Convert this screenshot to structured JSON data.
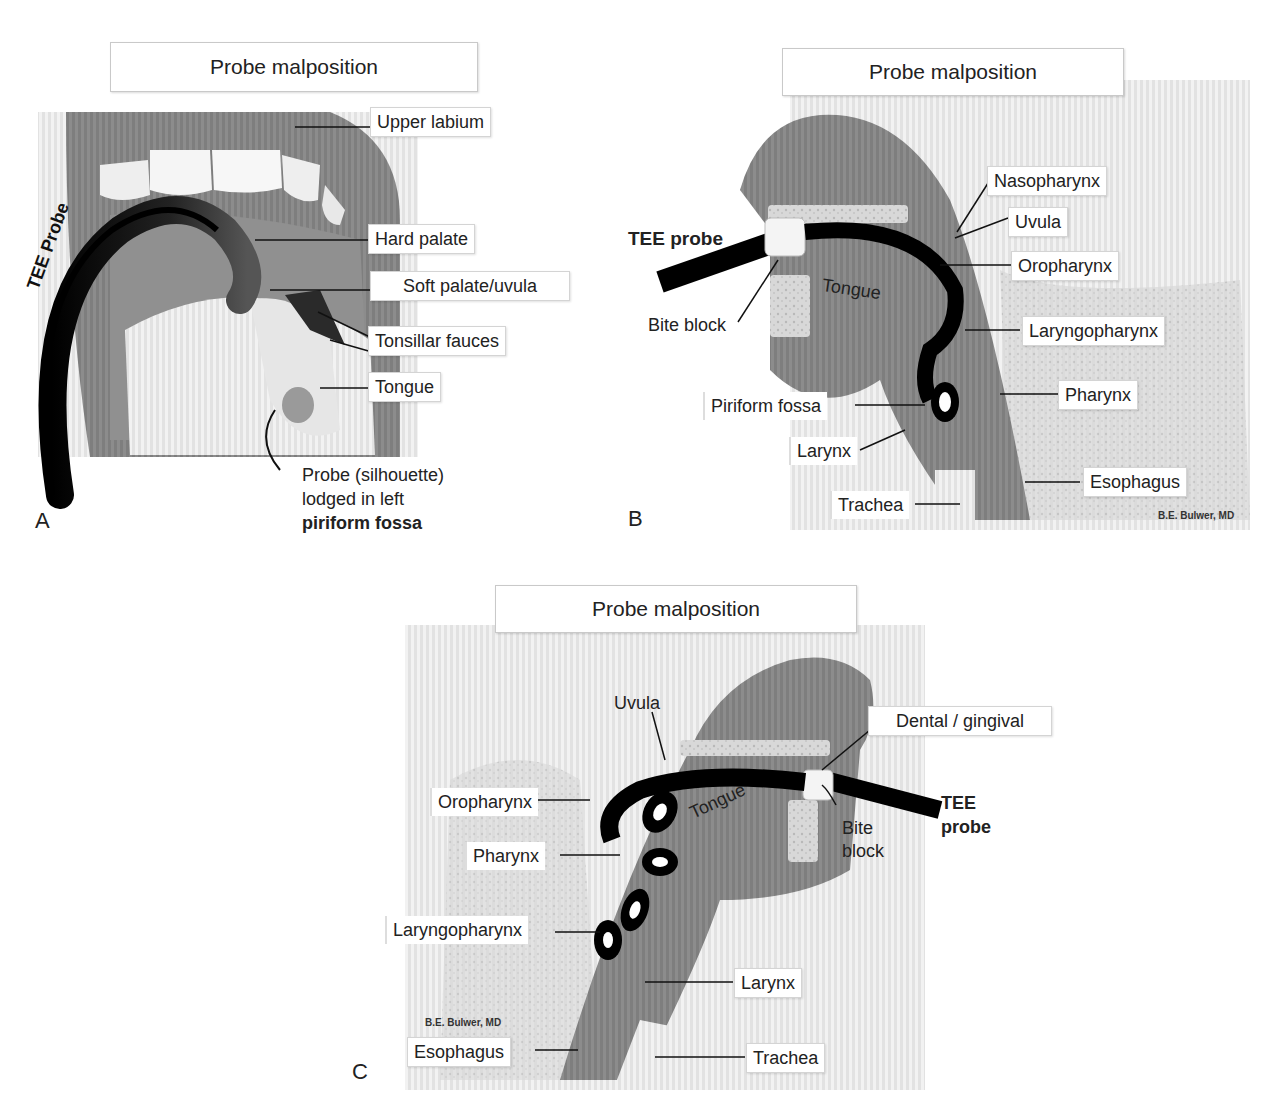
{
  "figure": {
    "panels": [
      {
        "letter": "A",
        "title": "Probe malposition",
        "probe_label": "TEE Probe",
        "labels": [
          {
            "text": "Upper labium"
          },
          {
            "text": "Hard palate"
          },
          {
            "text": "Soft palate/uvula"
          },
          {
            "text": "Tonsillar fauces"
          },
          {
            "text": "Tongue"
          }
        ],
        "caption": {
          "line1": "Probe (silhouette)",
          "line2": "lodged in left",
          "line3_bold": "piriform fossa"
        }
      },
      {
        "letter": "B",
        "title": "Probe malposition",
        "probe_label": "TEE probe",
        "inline_labels": {
          "tongue": "Tongue",
          "bite_block": "Bite block"
        },
        "labels": [
          {
            "text": "Nasopharynx"
          },
          {
            "text": "Uvula"
          },
          {
            "text": "Oropharynx"
          },
          {
            "text": "Laryngopharynx"
          },
          {
            "text": "Piriform fossa"
          },
          {
            "text": "Pharynx"
          },
          {
            "text": "Larynx"
          },
          {
            "text": "Esophagus"
          },
          {
            "text": "Trachea"
          }
        ],
        "credit": "B.E. Bulwer, MD"
      },
      {
        "letter": "C",
        "title": "Probe malposition",
        "probe_label_line1": "TEE",
        "probe_label_line2": "probe",
        "inline_labels": {
          "tongue": "Tongue",
          "uvula": "Uvula",
          "bite_line1": "Bite",
          "bite_line2": "block"
        },
        "labels": [
          {
            "text": "Dental / gingival"
          },
          {
            "text": "Oropharynx"
          },
          {
            "text": "Pharynx"
          },
          {
            "text": "Laryngopharynx"
          },
          {
            "text": "Larynx"
          },
          {
            "text": "Esophagus"
          },
          {
            "text": "Trachea"
          }
        ],
        "credit": "B.E. Bulwer, MD"
      }
    ],
    "colors": {
      "tissue": "#8a8a8a",
      "tissue_dark": "#5e5e5e",
      "background_stripes": "#e6e6e6",
      "probe": "#111111",
      "teeth": "#f4f4f4"
    }
  }
}
